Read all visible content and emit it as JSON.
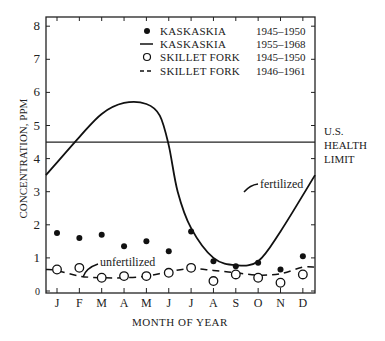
{
  "chart_data": {
    "type": "line",
    "title": "",
    "xlabel": "MONTH OF YEAR",
    "ylabel": "CONCENTRATION, PPM",
    "ylim": [
      0,
      8
    ],
    "yticks": [
      "0",
      "1",
      "2",
      "3",
      "4",
      "5",
      "6",
      "7",
      "8"
    ],
    "categories": [
      "J",
      "F",
      "M",
      "A",
      "M",
      "J",
      "J",
      "A",
      "S",
      "O",
      "N",
      "D"
    ],
    "grid": false,
    "legend_position": "top-right inside",
    "reference_line": {
      "value": 4.5,
      "label": "U.S. HEALTH LIMIT"
    },
    "annotations": [
      {
        "text": "fertilized",
        "near": "Kaskaskia 1955-1968 curve, Aug"
      },
      {
        "text": "unfertilized",
        "near": "Skillet Fork 1946-1961 curve, Feb"
      }
    ],
    "series": [
      {
        "name": "KASKASKIA",
        "period": "1945–1950",
        "style": "filled dots",
        "values": [
          1.75,
          1.6,
          1.7,
          1.35,
          1.5,
          1.2,
          1.8,
          0.9,
          0.75,
          0.85,
          0.65,
          1.05
        ]
      },
      {
        "name": "KASKASKIA",
        "period": "1955–1968",
        "style": "solid line",
        "values": [
          3.5,
          4.6,
          5.4,
          5.7,
          5.65,
          3.8,
          1.9,
          1.0,
          0.75,
          0.9,
          2.0,
          3.5
        ]
      },
      {
        "name": "SKILLET FORK",
        "period": "1945–1950",
        "style": "open circles",
        "values": [
          0.65,
          0.7,
          0.4,
          0.45,
          0.45,
          0.55,
          0.7,
          0.3,
          0.5,
          0.4,
          0.25,
          0.5
        ]
      },
      {
        "name": "SKILLET FORK",
        "period": "1946–1961",
        "style": "dashed line",
        "values": [
          0.62,
          0.45,
          0.4,
          0.4,
          0.45,
          0.58,
          0.68,
          0.62,
          0.55,
          0.48,
          0.52,
          0.72
        ]
      }
    ]
  },
  "legend": [
    {
      "marker": "filled-dot",
      "label": "KASKASKIA",
      "period": "1945–1950"
    },
    {
      "marker": "solid-line",
      "label": "KASKASKIA",
      "period": "1955–1968"
    },
    {
      "marker": "open-circle",
      "label": "SKILLET FORK",
      "period": "1945–1950"
    },
    {
      "marker": "dashed-line",
      "label": "SKILLET FORK",
      "period": "1946–1961"
    }
  ],
  "labels": {
    "health_limit": [
      "U.S.",
      "HEALTH",
      "LIMIT"
    ],
    "fertilized": "fertilized",
    "unfertilized": "unfertilized"
  }
}
